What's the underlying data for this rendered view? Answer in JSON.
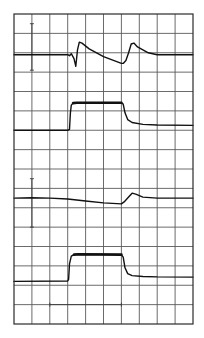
{
  "chart_data": {
    "type": "line",
    "title": "",
    "xlabel": "",
    "ylabel": "",
    "grid": true,
    "legend": null,
    "grid_divisions": {
      "columns": 10,
      "rows": 16
    },
    "axis_ranges": {
      "x": [
        0,
        10
      ],
      "y": [
        0,
        16
      ]
    },
    "units": "graticule divisions (x: left→right, y: bottom→top)",
    "series": [
      {
        "name": "trace-1",
        "style": "thin",
        "points": [
          [
            0,
            13.9
          ],
          [
            3.0,
            13.9
          ],
          [
            3.1,
            13.85
          ],
          [
            3.2,
            13.95
          ],
          [
            3.35,
            13.7
          ],
          [
            3.45,
            13.3
          ],
          [
            3.55,
            14.15
          ],
          [
            3.65,
            14.55
          ],
          [
            3.8,
            14.5
          ],
          [
            4.2,
            14.2
          ],
          [
            5.0,
            13.8
          ],
          [
            6.0,
            13.45
          ],
          [
            6.1,
            13.45
          ],
          [
            6.25,
            13.6
          ],
          [
            6.4,
            14.0
          ],
          [
            6.55,
            14.45
          ],
          [
            6.7,
            14.5
          ],
          [
            6.9,
            14.3
          ],
          [
            7.5,
            14.0
          ],
          [
            8.0,
            13.9
          ],
          [
            10,
            13.9
          ]
        ]
      },
      {
        "name": "trace-2",
        "style": "thick-top pulse",
        "points": [
          [
            0,
            10.0
          ],
          [
            3.0,
            10.0
          ],
          [
            3.1,
            10.05
          ],
          [
            3.15,
            10.9
          ],
          [
            3.2,
            11.3
          ],
          [
            3.3,
            11.4
          ],
          [
            3.5,
            11.42
          ],
          [
            6.0,
            11.42
          ],
          [
            6.1,
            11.35
          ],
          [
            6.2,
            10.9
          ],
          [
            6.35,
            10.55
          ],
          [
            6.6,
            10.4
          ],
          [
            7.2,
            10.3
          ],
          [
            8.0,
            10.27
          ],
          [
            10,
            10.25
          ]
        ]
      },
      {
        "name": "trace-3",
        "style": "thin",
        "points": [
          [
            0,
            6.5
          ],
          [
            1.0,
            6.52
          ],
          [
            2.0,
            6.5
          ],
          [
            3.0,
            6.45
          ],
          [
            4.0,
            6.35
          ],
          [
            5.0,
            6.25
          ],
          [
            6.0,
            6.2
          ],
          [
            6.15,
            6.3
          ],
          [
            6.4,
            6.55
          ],
          [
            6.6,
            6.75
          ],
          [
            6.8,
            6.7
          ],
          [
            7.2,
            6.55
          ],
          [
            8.0,
            6.5
          ],
          [
            10,
            6.5
          ]
        ]
      },
      {
        "name": "trace-4",
        "style": "thick-top pulse",
        "points": [
          [
            0,
            2.2
          ],
          [
            3.0,
            2.22
          ],
          [
            3.05,
            2.3
          ],
          [
            3.1,
            3.1
          ],
          [
            3.2,
            3.5
          ],
          [
            3.35,
            3.58
          ],
          [
            3.6,
            3.6
          ],
          [
            6.0,
            3.58
          ],
          [
            6.1,
            3.45
          ],
          [
            6.2,
            2.9
          ],
          [
            6.35,
            2.6
          ],
          [
            6.6,
            2.5
          ],
          [
            7.2,
            2.45
          ],
          [
            8.0,
            2.43
          ],
          [
            10,
            2.42
          ]
        ]
      }
    ],
    "annotations": [
      {
        "type": "vertical-scale-bar",
        "x": 1.0,
        "y_range": [
          13.1,
          15.5
        ]
      },
      {
        "type": "vertical-scale-bar",
        "x": 1.0,
        "y_range": [
          5.0,
          7.5
        ]
      },
      {
        "type": "horizontal-scale-bar",
        "y": 1.0,
        "x_range": [
          2.0,
          6.0
        ]
      }
    ]
  },
  "layout": {
    "plot_left": 14,
    "plot_top": 14,
    "plot_width": 179,
    "plot_height": 310,
    "colors": {
      "grid": "#5a5a5a",
      "trace": "#111111",
      "frame": "#2a2a2a",
      "background": "#ffffff"
    }
  }
}
